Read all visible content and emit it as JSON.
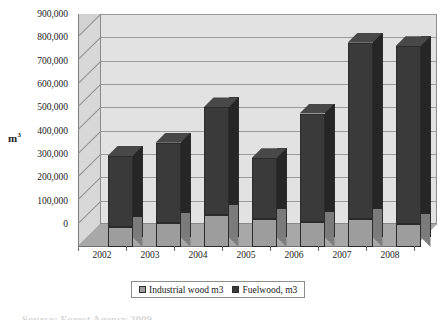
{
  "chart_data": {
    "type": "bar",
    "subtype": "stacked-column-3d",
    "title": "",
    "xlabel": "",
    "ylabel": "m3",
    "ylabel_display": "m",
    "ylabel_superscript": "3",
    "categories": [
      "2002",
      "2003",
      "2004",
      "2005",
      "2006",
      "2007",
      "2008"
    ],
    "series": [
      {
        "name": "Industrial wood m3",
        "color": "#9d9d9d",
        "values": [
          85000,
          103000,
          138000,
          120000,
          108000,
          120000,
          98000
        ]
      },
      {
        "name": "Fuelwood, m3",
        "color": "#3a3a3a",
        "values": [
          305000,
          344000,
          460000,
          260000,
          464000,
          755000,
          762000
        ]
      }
    ],
    "totals": [
      390000,
      447000,
      598000,
      380000,
      572000,
      875000,
      860000
    ],
    "ylim": [
      0,
      900000
    ],
    "ytick_step": 100000,
    "ytick_labels": [
      "900,000",
      "800,000",
      "700,000",
      "600,000",
      "500,000",
      "400,000",
      "300,000",
      "200,000",
      "100,000",
      "0"
    ],
    "ytick_values": [
      900000,
      800000,
      700000,
      600000,
      500000,
      400000,
      300000,
      200000,
      100000,
      0
    ],
    "grid": true,
    "grid_axis": "y",
    "legend_position": "bottom",
    "stacked": true
  },
  "legend": {
    "entries": [
      {
        "label": "Industrial wood m3",
        "color": "#9d9d9d"
      },
      {
        "label": "Fuelwood, m3",
        "color": "#3a3a3a"
      }
    ]
  },
  "colors": {
    "plot_background": "#e2e2e2",
    "side_wall": "#d8d8d8",
    "floor": "#a8a8a8",
    "gridline": "#9a9a9a",
    "series_industrial": "#9d9d9d",
    "series_fuelwood": "#3a3a3a",
    "outline": "#2b2b2b",
    "page_background": "#ffffff"
  },
  "caption": {
    "cut_off_text": "Source: Forest Agency 2009"
  }
}
